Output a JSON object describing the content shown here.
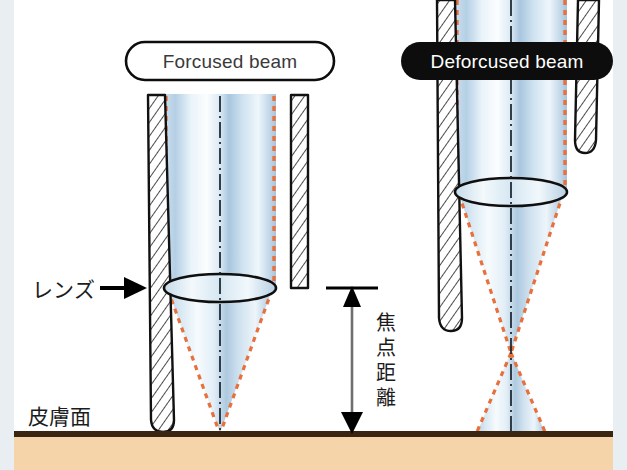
{
  "figure": {
    "title_left": "Forcused beam",
    "title_right": "Deforcused beam",
    "label_lens": "レンズ",
    "label_skin": "皮膚面",
    "label_focal_distance_chars": [
      "焦",
      "点",
      "距",
      "離"
    ],
    "label_focal_distance": "焦点距離"
  },
  "colors": {
    "beam_light": "#f2f7fb",
    "beam_mid": "#b9d3e6",
    "beam_dark": "#8fb4cf",
    "beam_edge_dashed": "#e8703c",
    "axis_line": "#1a1a1a",
    "wall_outline": "#111111",
    "wall_fill": "#ffffff",
    "hatch": "#333333",
    "skin_fill": "#f6d4a9",
    "skin_line": "#3a2412",
    "pill_dark_fill": "#0d0d0d",
    "pill_dark_text": "#ffffff",
    "pill_light_fill": "#ffffff",
    "pill_light_text": "#3a3a3a",
    "edge_strip": "#e9eef3",
    "arrow_black": "#000000",
    "gray_shaft": "#6f6f6f"
  },
  "geometry": {
    "canvas_width": 627,
    "canvas_height": 470,
    "skin_surface_y": 433,
    "left_focus_y": 433,
    "right_focus_y": 352,
    "left_lens_y": 288,
    "right_lens_y": 192,
    "focal_arrow_x": 352,
    "focal_arrow_top_y": 288,
    "focal_arrow_bottom_y": 433
  }
}
